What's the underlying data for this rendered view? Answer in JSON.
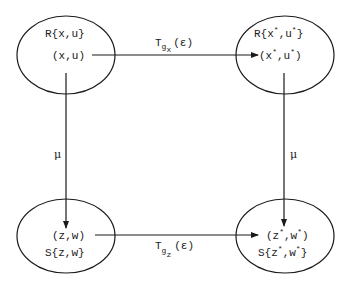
{
  "diagram": {
    "type": "commutative-diagram",
    "nodes": [
      {
        "id": "top-left",
        "set_label": "R{x,u}",
        "point_label": "(x,u)"
      },
      {
        "id": "top-right",
        "set_label_base": "R{x",
        "set_label_star1": "*",
        "set_label_mid": ",u",
        "set_label_star2": "*",
        "set_label_end": "}",
        "point_label_base": "(x",
        "point_label_star1": "*",
        "point_label_mid": ",u",
        "point_label_star2": "*",
        "point_label_end": ")"
      },
      {
        "id": "bottom-left",
        "point_label": "(z,w)",
        "set_label": "S{z,w}"
      },
      {
        "id": "bottom-right",
        "point_label_base": "(z",
        "point_label_star1": "*",
        "point_label_mid": ",w",
        "point_label_star2": "*",
        "point_label_end": ")",
        "set_label_base": "S{z",
        "set_label_star1": "*",
        "set_label_mid": ",w",
        "set_label_star2": "*",
        "set_label_end": "}"
      }
    ],
    "edges": [
      {
        "id": "top-arrow",
        "from": "top-left",
        "to": "top-right",
        "label_T": "T",
        "label_sub": "g",
        "label_subsub": "x",
        "label_arg": "(ε)"
      },
      {
        "id": "bottom-arrow",
        "from": "bottom-left",
        "to": "bottom-right",
        "label_T": "T",
        "label_sub": "g",
        "label_subsub": "z",
        "label_arg": "(ε)"
      },
      {
        "id": "left-arrow",
        "from": "top-left",
        "to": "bottom-left",
        "label": "μ"
      },
      {
        "id": "right-arrow",
        "from": "top-right",
        "to": "bottom-right",
        "label": "μ"
      }
    ],
    "colors": {
      "stroke": "#1a1a1a",
      "background": "#ffffff"
    }
  }
}
